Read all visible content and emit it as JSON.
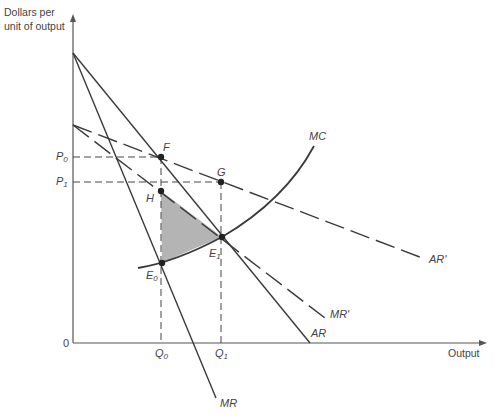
{
  "axes": {
    "y_label_line1": "Dollars per",
    "y_label_line2": "unit of output",
    "x_label": "Output",
    "origin": "0"
  },
  "price_labels": {
    "p0_main": "P",
    "p0_sub": "0",
    "p1_main": "P",
    "p1_sub": "1"
  },
  "quantity_labels": {
    "q0_main": "Q",
    "q0_sub": "0",
    "q1_main": "Q",
    "q1_sub": "1"
  },
  "points": {
    "F": "F",
    "G": "G",
    "H": "H",
    "E0_main": "E",
    "E0_sub": "0",
    "E1_main": "E",
    "E1_sub": "1"
  },
  "curves": {
    "MC": "MC",
    "AR": "AR",
    "MR": "MR",
    "AR_prime": "AR'",
    "MR_prime": "MR'"
  },
  "colors": {
    "line": "#3a3a3a",
    "axis": "#555555",
    "shade": "#b4b4b4"
  }
}
